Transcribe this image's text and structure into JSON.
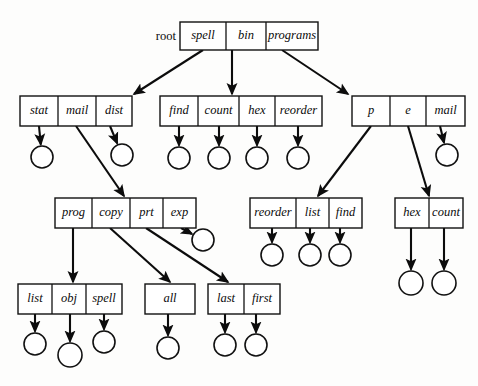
{
  "figure": {
    "title": "",
    "kind": "tree-diagram",
    "colors": {
      "background": "#fdfdfc",
      "stroke": "#111111",
      "text": "#0b0b0b",
      "node_fill": "#ffffff"
    }
  },
  "root_label": "root",
  "nodes": [
    {
      "id": "root",
      "x": 180,
      "y": 22,
      "w": 138,
      "h": 28,
      "cells": [
        {
          "label": "spell",
          "w": 46
        },
        {
          "label": "bin",
          "w": 40
        },
        {
          "label": "programs",
          "w": 52
        }
      ]
    },
    {
      "id": "dir-spell",
      "x": 20,
      "y": 96,
      "w": 112,
      "h": 30,
      "cells": [
        {
          "label": "stat",
          "w": 38
        },
        {
          "label": "mail",
          "w": 38
        },
        {
          "label": "dist",
          "w": 36
        }
      ]
    },
    {
      "id": "dir-bin",
      "x": 160,
      "y": 96,
      "w": 162,
      "h": 30,
      "cells": [
        {
          "label": "find",
          "w": 38
        },
        {
          "label": "count",
          "w": 41
        },
        {
          "label": "hex",
          "w": 36
        },
        {
          "label": "reorder",
          "w": 47
        }
      ]
    },
    {
      "id": "dir-programs",
      "x": 352,
      "y": 96,
      "w": 113,
      "h": 30,
      "cells": [
        {
          "label": "p",
          "w": 38
        },
        {
          "label": "e",
          "w": 36
        },
        {
          "label": "mail",
          "w": 39
        }
      ]
    },
    {
      "id": "dir-mail",
      "x": 55,
      "y": 198,
      "w": 141,
      "h": 30,
      "cells": [
        {
          "label": "prog",
          "w": 37
        },
        {
          "label": "copy",
          "w": 38
        },
        {
          "label": "prt",
          "w": 33
        },
        {
          "label": "exp",
          "w": 33
        }
      ]
    },
    {
      "id": "dir-p",
      "x": 250,
      "y": 198,
      "w": 112,
      "h": 30,
      "cells": [
        {
          "label": "reorder",
          "w": 46
        },
        {
          "label": "list",
          "w": 33
        },
        {
          "label": "find",
          "w": 33
        }
      ]
    },
    {
      "id": "dir-e",
      "x": 395,
      "y": 198,
      "w": 68,
      "h": 30,
      "cells": [
        {
          "label": "hex",
          "w": 34
        },
        {
          "label": "count",
          "w": 34
        }
      ]
    },
    {
      "id": "dir-prog",
      "x": 18,
      "y": 284,
      "w": 104,
      "h": 30,
      "cells": [
        {
          "label": "list",
          "w": 34
        },
        {
          "label": "obj",
          "w": 34
        },
        {
          "label": "spell",
          "w": 36
        }
      ]
    },
    {
      "id": "dir-copy",
      "x": 145,
      "y": 284,
      "w": 50,
      "h": 30,
      "cells": [
        {
          "label": "all",
          "w": 50
        }
      ]
    },
    {
      "id": "dir-prt",
      "x": 208,
      "y": 284,
      "w": 72,
      "h": 30,
      "cells": [
        {
          "label": "last",
          "w": 36
        },
        {
          "label": "first",
          "w": 36
        }
      ]
    }
  ],
  "edges": [
    {
      "from": "root.spell",
      "x1": 203,
      "y1": 50,
      "x2": 134,
      "y2": 94,
      "kind": "pointer"
    },
    {
      "from": "root.bin",
      "x1": 232,
      "y1": 50,
      "x2": 232,
      "y2": 94,
      "kind": "pointer"
    },
    {
      "from": "root.programs",
      "x1": 282,
      "y1": 50,
      "x2": 348,
      "y2": 94,
      "kind": "pointer"
    },
    {
      "from": "dir-mail.mail",
      "x1": 76,
      "y1": 126,
      "x2": 124,
      "y2": 196,
      "kind": "pointer"
    },
    {
      "from": "dir-programs.p",
      "x1": 371,
      "y1": 126,
      "x2": 318,
      "y2": 196,
      "kind": "pointer"
    },
    {
      "from": "dir-programs.e",
      "x1": 408,
      "y1": 126,
      "x2": 429,
      "y2": 196,
      "kind": "pointer"
    },
    {
      "from": "dir-mail.prog",
      "x1": 73,
      "y1": 228,
      "x2": 73,
      "y2": 282,
      "kind": "pointer"
    },
    {
      "from": "dir-mail.copy",
      "x1": 110,
      "y1": 228,
      "x2": 170,
      "y2": 282,
      "kind": "pointer"
    },
    {
      "from": "dir-mail.prt",
      "x1": 146,
      "y1": 228,
      "x2": 228,
      "y2": 282,
      "kind": "pointer"
    }
  ],
  "leaves": [
    {
      "owner": "dir-spell.stat",
      "x1": 39,
      "y1": 126,
      "cx": 42,
      "cy": 157,
      "r": 11
    },
    {
      "owner": "dir-spell.dist",
      "x1": 110,
      "y1": 126,
      "cx": 122,
      "cy": 155,
      "r": 11
    },
    {
      "owner": "dir-bin.find",
      "x1": 179,
      "y1": 126,
      "cx": 179,
      "cy": 158,
      "r": 11
    },
    {
      "owner": "dir-bin.count",
      "x1": 219,
      "y1": 126,
      "cx": 219,
      "cy": 158,
      "r": 11
    },
    {
      "owner": "dir-bin.hex",
      "x1": 257,
      "y1": 126,
      "cx": 257,
      "cy": 158,
      "r": 11
    },
    {
      "owner": "dir-bin.reorder",
      "x1": 298,
      "y1": 126,
      "cx": 298,
      "cy": 158,
      "r": 11
    },
    {
      "owner": "dir-programs.mail",
      "x1": 440,
      "y1": 126,
      "cx": 447,
      "cy": 155,
      "r": 11
    },
    {
      "owner": "dir-mail.exp",
      "x1": 181,
      "y1": 228,
      "cx": 203,
      "cy": 240,
      "r": 11
    },
    {
      "owner": "dir-p.reorder",
      "x1": 272,
      "y1": 228,
      "cx": 272,
      "cy": 255,
      "r": 11
    },
    {
      "owner": "dir-p.list",
      "x1": 310,
      "y1": 228,
      "cx": 310,
      "cy": 255,
      "r": 11
    },
    {
      "owner": "dir-p.find",
      "x1": 340,
      "y1": 228,
      "cx": 340,
      "cy": 255,
      "r": 11
    },
    {
      "owner": "dir-e.hex",
      "x1": 411,
      "y1": 228,
      "cx": 411,
      "cy": 283,
      "r": 12
    },
    {
      "owner": "dir-e.count",
      "x1": 444,
      "y1": 228,
      "cx": 444,
      "cy": 283,
      "r": 12
    },
    {
      "owner": "dir-prog.list",
      "x1": 35,
      "y1": 314,
      "cx": 35,
      "cy": 344,
      "r": 11
    },
    {
      "owner": "dir-prog.obj",
      "x1": 70,
      "y1": 314,
      "cx": 70,
      "cy": 355,
      "r": 12
    },
    {
      "owner": "dir-prog.spell",
      "x1": 104,
      "y1": 314,
      "cx": 104,
      "cy": 342,
      "r": 11
    },
    {
      "owner": "dir-copy.all",
      "x1": 168,
      "y1": 314,
      "cx": 168,
      "cy": 348,
      "r": 11
    },
    {
      "owner": "dir-prt.last",
      "x1": 225,
      "y1": 314,
      "cx": 225,
      "cy": 345,
      "r": 11
    },
    {
      "owner": "dir-prt.first",
      "x1": 256,
      "y1": 314,
      "cx": 256,
      "cy": 345,
      "r": 11
    }
  ]
}
